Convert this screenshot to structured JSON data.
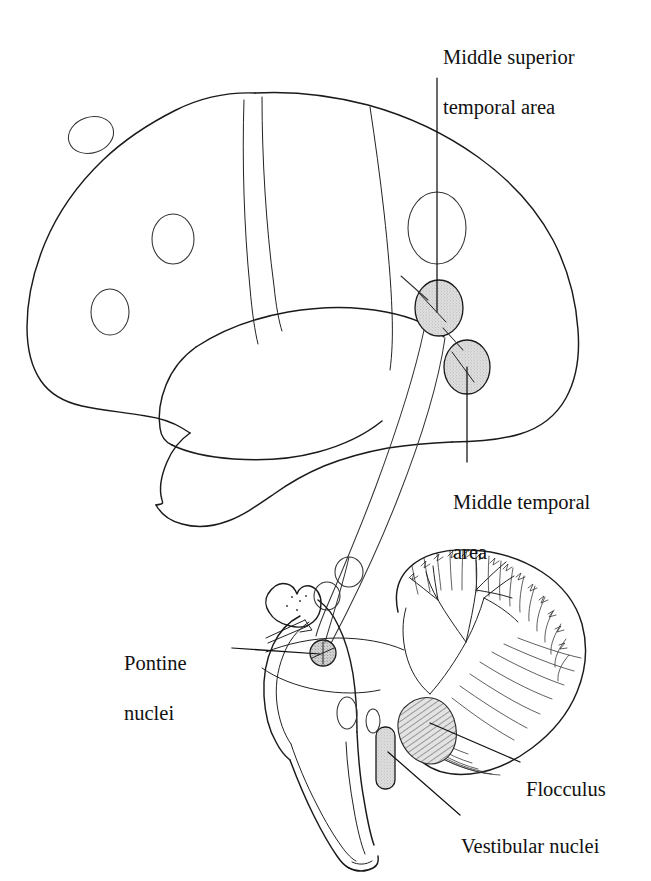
{
  "figure": {
    "background_color": "#ffffff",
    "ink_color": "#1a1a1a",
    "shaded_fill_color": "#d6d6d6"
  },
  "labels": {
    "mst": {
      "line1": "Middle superior",
      "line2": "temporal area",
      "full": "Middle superior temporal area"
    },
    "mt": {
      "line1": "Middle temporal",
      "line2": "area",
      "full": "Middle temporal area"
    },
    "pontine": {
      "line1": "Pontine",
      "line2": "nuclei",
      "full": "Pontine nuclei"
    },
    "flocculus": {
      "line1": "Flocculus",
      "full": "Flocculus"
    },
    "vestibular": {
      "line1": "Vestibular nuclei",
      "full": "Vestibular nuclei"
    }
  },
  "structures": [
    {
      "name": "cerebral-hemisphere",
      "shaded": false
    },
    {
      "name": "temporal-lobe",
      "shaded": false
    },
    {
      "name": "frontal-marker-ellipse-1",
      "shaded": false
    },
    {
      "name": "frontal-marker-ellipse-2",
      "shaded": false
    },
    {
      "name": "frontal-marker-ellipse-3",
      "shaded": false
    },
    {
      "name": "mst-target-ellipse",
      "shaded": false
    },
    {
      "name": "mst-region-ellipse",
      "shaded": true
    },
    {
      "name": "mt-region-ellipse",
      "shaded": true
    },
    {
      "name": "pontine-nuclei-marker",
      "shaded": true
    },
    {
      "name": "vestibular-nuclei-bar",
      "shaded": true
    },
    {
      "name": "flocculus-region",
      "shaded": true
    },
    {
      "name": "cerebellum",
      "shaded": false
    },
    {
      "name": "brainstem",
      "shaded": false
    }
  ]
}
